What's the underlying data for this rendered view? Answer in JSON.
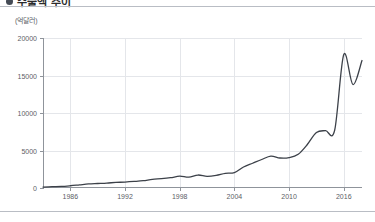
{
  "header": {
    "title": "수출액 추이",
    "bullet_icon": "bullet-dot-icon"
  },
  "chart_data": {
    "type": "line",
    "title": "수출액 추이",
    "unit_label": "(억달러)",
    "xlabel": "",
    "ylabel": "",
    "ylim": [
      0,
      20000
    ],
    "xlim": [
      1983,
      2018
    ],
    "grid": true,
    "legend": false,
    "line_color": "#3c4149",
    "y_ticks": [
      0,
      5000,
      10000,
      15000,
      20000
    ],
    "y_tick_labels": [
      "0",
      "5000",
      "10000",
      "15000",
      "20000"
    ],
    "x_ticks": [
      1986,
      1992,
      1998,
      2004,
      2010,
      2016
    ],
    "x_tick_labels": [
      "1986",
      "1992",
      "1998",
      "2004",
      "2010",
      "2016"
    ],
    "series": [
      {
        "name": "수출액",
        "x": [
          1983,
          1984,
          1985,
          1986,
          1987,
          1988,
          1989,
          1990,
          1991,
          1992,
          1993,
          1994,
          1995,
          1996,
          1997,
          1998,
          1999,
          2000,
          2001,
          2002,
          2003,
          2004,
          2005,
          2006,
          2007,
          2008,
          2009,
          2010,
          2011,
          2012,
          2013,
          2014,
          2015,
          2016,
          2017,
          2018
        ],
        "values": [
          130,
          180,
          210,
          300,
          420,
          540,
          600,
          660,
          740,
          790,
          870,
          970,
          1160,
          1240,
          1370,
          1580,
          1440,
          1730,
          1560,
          1680,
          1950,
          2050,
          2800,
          3300,
          3800,
          4250,
          4000,
          4050,
          4500,
          5800,
          7400,
          7650,
          7700,
          17800,
          13800,
          17000
        ]
      }
    ],
    "annotations": {
      "peak_value": 17800,
      "peak_year": 2014,
      "trough_value": 13800,
      "trough_year": 2016,
      "end_value": 17000,
      "end_year": 2017
    }
  }
}
